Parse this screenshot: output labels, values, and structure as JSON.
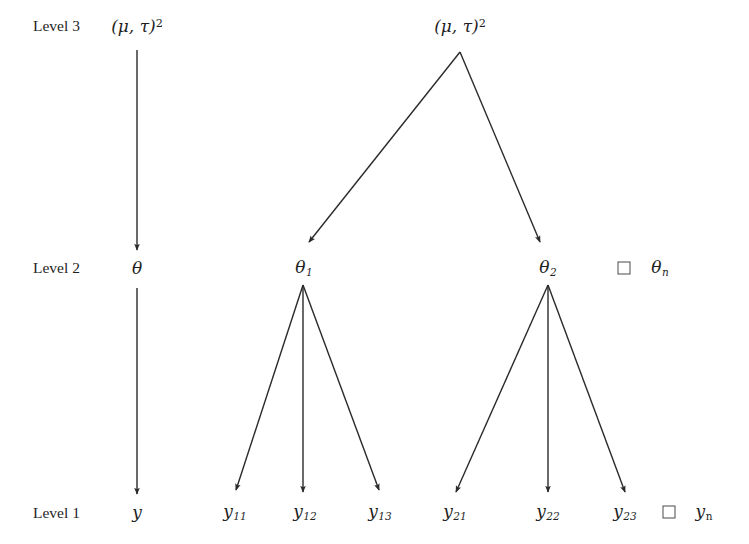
{
  "figure": {
    "background_color": "#ffffff",
    "line_color": "#2a2a2a",
    "text_color": "#1f1f1f"
  },
  "levels": [
    {
      "id": "level3",
      "label": "Level 3",
      "x": 33,
      "y": 33
    },
    {
      "id": "level2",
      "label": "Level 2",
      "x": 33,
      "y": 275
    },
    {
      "id": "level1",
      "label": "Level 1",
      "x": 33,
      "y": 520
    }
  ],
  "nodes": {
    "left_column": [
      {
        "id": "left-hyper",
        "label": "(μ, τ)",
        "sup": "2",
        "x": 137,
        "y": 35,
        "kind": "hyperparameter"
      },
      {
        "id": "left-theta",
        "label": "θ",
        "sub": "",
        "x": 137,
        "y": 277,
        "kind": "parameter"
      },
      {
        "id": "left-y",
        "label": "y",
        "sub": "",
        "x": 137,
        "y": 521,
        "kind": "observation"
      }
    ],
    "right_hyper": {
      "id": "right-hyper",
      "label": "(μ, τ)",
      "sup": "2",
      "x": 460,
      "y": 35,
      "kind": "hyperparameter"
    },
    "level2_thetas": [
      {
        "id": "theta-1",
        "label": "θ",
        "sub": "1",
        "x": 304,
        "y": 277,
        "kind": "parameter"
      },
      {
        "id": "theta-2",
        "label": "θ",
        "sub": "2",
        "x": 548,
        "y": 277,
        "kind": "parameter"
      },
      {
        "id": "theta-n",
        "label": "θ",
        "sub": "n",
        "sub_upright": false,
        "x": 660,
        "y": 277,
        "kind": "parameter"
      }
    ],
    "level1_ys": [
      {
        "id": "y-11",
        "label": "y",
        "sub": "11",
        "x": 235,
        "y": 521,
        "kind": "observation"
      },
      {
        "id": "y-12",
        "label": "y",
        "sub": "12",
        "x": 305,
        "y": 521,
        "kind": "observation"
      },
      {
        "id": "y-13",
        "label": "y",
        "sub": "13",
        "x": 380,
        "y": 521,
        "kind": "observation"
      },
      {
        "id": "y-21",
        "label": "y",
        "sub": "21",
        "x": 455,
        "y": 521,
        "kind": "observation"
      },
      {
        "id": "y-22",
        "label": "y",
        "sub": "22",
        "x": 548,
        "y": 521,
        "kind": "observation"
      },
      {
        "id": "y-23",
        "label": "y",
        "sub": "23",
        "x": 625,
        "y": 521,
        "kind": "observation"
      },
      {
        "id": "y-n",
        "label": "y",
        "sub": "n",
        "sub_upright": true,
        "x": 704,
        "y": 521,
        "kind": "observation"
      }
    ]
  },
  "ellipsis_boxes": [
    {
      "id": "ellipsis-level2",
      "x": 624,
      "y": 268
    },
    {
      "id": "ellipsis-level1",
      "x": 669,
      "y": 512
    }
  ],
  "edges": [
    {
      "id": "edge-left-hyper-theta",
      "x1": 137,
      "y1": 50,
      "x2": 137,
      "y2": 250
    },
    {
      "id": "edge-left-theta-y",
      "x1": 137,
      "y1": 288,
      "x2": 137,
      "y2": 494
    },
    {
      "id": "edge-hyper-theta1",
      "x1": 460,
      "y1": 52,
      "x2": 309,
      "y2": 242
    },
    {
      "id": "edge-hyper-theta2",
      "x1": 460,
      "y1": 52,
      "x2": 540,
      "y2": 242
    },
    {
      "id": "edge-theta1-y11",
      "x1": 303,
      "y1": 285,
      "x2": 236,
      "y2": 490
    },
    {
      "id": "edge-theta1-y12",
      "x1": 303,
      "y1": 285,
      "x2": 303,
      "y2": 492
    },
    {
      "id": "edge-theta1-y13",
      "x1": 303,
      "y1": 285,
      "x2": 379,
      "y2": 490
    },
    {
      "id": "edge-theta2-y21",
      "x1": 548,
      "y1": 285,
      "x2": 456,
      "y2": 492
    },
    {
      "id": "edge-theta2-y22",
      "x1": 548,
      "y1": 285,
      "x2": 548,
      "y2": 492
    },
    {
      "id": "edge-theta2-y23",
      "x1": 548,
      "y1": 285,
      "x2": 625,
      "y2": 492
    }
  ]
}
